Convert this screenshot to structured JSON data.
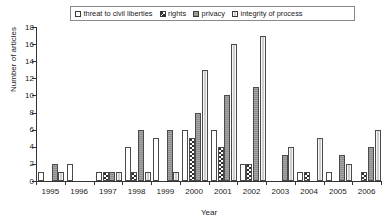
{
  "chart_data": {
    "type": "bar",
    "title": "",
    "xlabel": "Year",
    "ylabel": "Number of articles",
    "ylim": [
      0,
      18
    ],
    "ytick_step": 2,
    "yticks": [
      0,
      2,
      4,
      6,
      8,
      10,
      12,
      14,
      16,
      18
    ],
    "grid": false,
    "legend_position": "top",
    "categories": [
      "1995",
      "1996",
      "1997",
      "1998",
      "1999",
      "2000",
      "2001",
      "2002",
      "2003",
      "2004",
      "2005",
      "2006"
    ],
    "series": [
      {
        "name": "threat to civil liberties",
        "key": "threat",
        "fill": "white",
        "values": [
          1,
          2,
          1,
          4,
          5,
          6,
          6,
          2,
          0,
          1,
          1,
          0
        ]
      },
      {
        "name": "rights",
        "key": "rights",
        "fill": "black-checkerboard",
        "values": [
          0,
          0,
          1,
          1,
          0,
          5,
          4,
          2,
          0,
          1,
          0,
          1
        ]
      },
      {
        "name": "privacy",
        "key": "privacy",
        "fill": "medium-gray",
        "values": [
          2,
          0,
          1,
          6,
          6,
          8,
          10,
          11,
          3,
          0,
          3,
          4
        ]
      },
      {
        "name": "integrity of process",
        "key": "integrity",
        "fill": "light-gray-vertical-stripes",
        "values": [
          1,
          0,
          1,
          1,
          1,
          13,
          16,
          17,
          4,
          5,
          2,
          6
        ]
      }
    ]
  },
  "legend": {
    "items": [
      {
        "label": "threat to civil liberties",
        "swatch": "threat"
      },
      {
        "label": "rights",
        "swatch": "rights"
      },
      {
        "label": "privacy",
        "swatch": "privacy"
      },
      {
        "label": "integrity of process",
        "swatch": "integrity"
      }
    ]
  },
  "colors": {
    "threat": "#ffffff",
    "rights": "#2e2e2e",
    "privacy": "#8d8d8d",
    "integrity": "#cfcfcf",
    "axis": "#333333",
    "background": "#ffffff"
  }
}
